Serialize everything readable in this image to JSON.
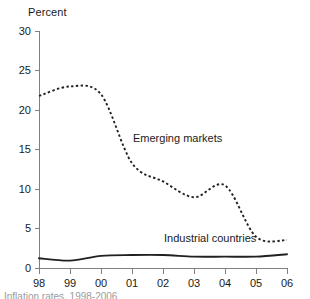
{
  "chart_data": {
    "type": "line",
    "title": "",
    "ylabel": "Percent",
    "xlabel": "",
    "x": [
      "98",
      "99",
      "00",
      "01",
      "02",
      "03",
      "04",
      "05",
      "06"
    ],
    "xlim": [
      1998,
      2006
    ],
    "ylim": [
      0,
      30
    ],
    "yticks": [
      0,
      5,
      10,
      15,
      20,
      25,
      30
    ],
    "xticks": [
      "98",
      "99",
      "00",
      "01",
      "02",
      "03",
      "04",
      "05",
      "06"
    ],
    "grid": false,
    "legend": "inline-annotations",
    "series": [
      {
        "name": "Emerging markets",
        "style": "dashed",
        "color": "#202020",
        "values": [
          21.8,
          23.0,
          22.0,
          13.3,
          11.0,
          9.0,
          10.5,
          4.0,
          3.6
        ],
        "label_x": "01",
        "label_y": 16.0
      },
      {
        "name": "Industrial countries",
        "style": "solid",
        "color": "#202020",
        "values": [
          1.3,
          1.0,
          1.6,
          1.7,
          1.7,
          1.5,
          1.5,
          1.5,
          1.8
        ],
        "label_x": "02",
        "label_y": 3.4
      }
    ],
    "annotations": [
      {
        "text": "Emerging markets"
      },
      {
        "text": "Industrial countries"
      }
    ]
  },
  "axis": {
    "y_title": "Percent",
    "y_ticks": [
      "30",
      "25",
      "20",
      "15",
      "10",
      "5",
      "0"
    ],
    "x_ticks": [
      "98",
      "99",
      "00",
      "01",
      "02",
      "03",
      "04",
      "05",
      "06"
    ]
  },
  "labels": {
    "emerging": "Emerging markets",
    "industrial": "Industrial countries"
  },
  "caption": {
    "clipped_text": "Inflation rates, 1998-2006"
  },
  "colors": {
    "line": "#202020",
    "axis": "#808080",
    "background": "#ffffff",
    "text": "#1a1a1a"
  }
}
